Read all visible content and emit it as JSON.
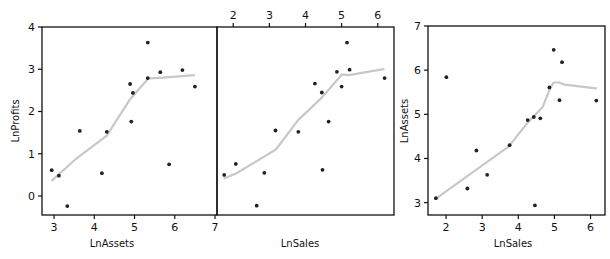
{
  "colors": {
    "points": "#222222",
    "smoother": "#c8c8c8",
    "axes": "#111111"
  },
  "chart_data": [
    {
      "type": "scatter",
      "title": "",
      "xlabel": "LnAssets",
      "ylabel": "LnProfits",
      "xlim": [
        2.7,
        7.05
      ],
      "ylim": [
        -0.45,
        4.0
      ],
      "xticks": [
        3,
        4,
        5,
        6,
        7
      ],
      "yticks": [
        0,
        1,
        2,
        3,
        4
      ],
      "x_axis_side": "bottom",
      "y_axis_side": "left",
      "grid": false,
      "points": [
        [
          2.94,
          0.61
        ],
        [
          3.12,
          0.48
        ],
        [
          3.33,
          -0.24
        ],
        [
          3.64,
          1.54
        ],
        [
          4.19,
          0.54
        ],
        [
          4.31,
          1.52
        ],
        [
          4.89,
          2.65
        ],
        [
          4.92,
          1.76
        ],
        [
          4.96,
          2.44
        ],
        [
          5.33,
          3.63
        ],
        [
          5.33,
          2.79
        ],
        [
          5.64,
          2.93
        ],
        [
          5.86,
          0.75
        ],
        [
          6.19,
          2.98
        ],
        [
          6.5,
          2.59
        ]
      ],
      "smoother": [
        [
          2.95,
          0.37
        ],
        [
          3.52,
          0.86
        ],
        [
          4.31,
          1.43
        ],
        [
          4.89,
          2.29
        ],
        [
          5.34,
          2.78
        ],
        [
          5.71,
          2.8
        ],
        [
          6.48,
          2.86
        ]
      ]
    },
    {
      "type": "scatter",
      "title": "",
      "xlabel": "LnSales",
      "ylabel": "",
      "xlim": [
        1.55,
        6.45
      ],
      "ylim": [
        -0.45,
        4.0
      ],
      "xticks": [
        2,
        3,
        4,
        5,
        6
      ],
      "yticks": [],
      "x_axis_side": "top",
      "y_axis_side": "none",
      "grid": false,
      "points": [
        [
          1.75,
          0.5
        ],
        [
          2.07,
          0.76
        ],
        [
          2.65,
          -0.23
        ],
        [
          2.86,
          0.55
        ],
        [
          3.17,
          1.55
        ],
        [
          3.8,
          1.52
        ],
        [
          4.64,
          1.76
        ],
        [
          4.47,
          0.62
        ],
        [
          4.26,
          2.66
        ],
        [
          4.45,
          2.45
        ],
        [
          4.87,
          2.94
        ],
        [
          5.0,
          2.59
        ],
        [
          5.15,
          3.63
        ],
        [
          5.22,
          2.99
        ],
        [
          6.19,
          2.79
        ]
      ],
      "smoother": [
        [
          1.76,
          0.42
        ],
        [
          2.09,
          0.54
        ],
        [
          3.18,
          1.1
        ],
        [
          3.79,
          1.79
        ],
        [
          4.45,
          2.33
        ],
        [
          5.01,
          2.88
        ],
        [
          5.2,
          2.86
        ],
        [
          6.16,
          3.0
        ]
      ]
    },
    {
      "type": "scatter",
      "title": "",
      "xlabel": "LnSales",
      "ylabel": "LnAssets",
      "xlim": [
        1.5,
        6.4
      ],
      "ylim": [
        2.72,
        7.0
      ],
      "xticks": [
        2,
        3,
        4,
        5,
        6
      ],
      "yticks": [
        3,
        4,
        5,
        6,
        7
      ],
      "x_axis_side": "bottom",
      "y_axis_side": "left",
      "grid": false,
      "points": [
        [
          1.72,
          3.1
        ],
        [
          2.01,
          5.84
        ],
        [
          2.59,
          3.32
        ],
        [
          2.84,
          4.18
        ],
        [
          3.14,
          3.63
        ],
        [
          3.76,
          4.3
        ],
        [
          4.26,
          4.87
        ],
        [
          4.43,
          4.94
        ],
        [
          4.61,
          4.91
        ],
        [
          4.46,
          2.94
        ],
        [
          4.86,
          5.61
        ],
        [
          4.98,
          6.46
        ],
        [
          5.14,
          5.32
        ],
        [
          5.21,
          6.18
        ],
        [
          6.16,
          5.31
        ]
      ],
      "smoother": [
        [
          1.75,
          3.11
        ],
        [
          2.79,
          3.72
        ],
        [
          3.73,
          4.27
        ],
        [
          4.25,
          4.8
        ],
        [
          4.67,
          5.16
        ],
        [
          4.86,
          5.55
        ],
        [
          4.98,
          5.72
        ],
        [
          5.14,
          5.72
        ],
        [
          5.28,
          5.67
        ],
        [
          6.15,
          5.59
        ]
      ]
    }
  ]
}
